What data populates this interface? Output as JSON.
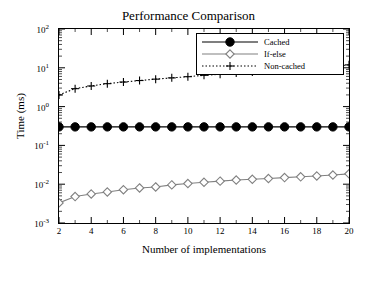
{
  "chart_data": {
    "type": "line",
    "title": "Performance Comparison",
    "xlabel": "Number of implementations",
    "ylabel": "Time (ms)",
    "yscale": "log",
    "xscale": "linear",
    "xlim": [
      2,
      20
    ],
    "ylim": [
      0.001,
      100
    ],
    "grid": false,
    "legend_position": "top-right",
    "x_ticks": [
      "2",
      "4",
      "6",
      "8",
      "10",
      "12",
      "14",
      "16",
      "18",
      "20"
    ],
    "x_tick_values": [
      2,
      4,
      6,
      8,
      10,
      12,
      14,
      16,
      18,
      20
    ],
    "y_ticks": [
      "10^-3",
      "10^-2",
      "10^-1",
      "10^0",
      "10^1",
      "10^2"
    ],
    "y_tick_values": [
      0.001,
      0.01,
      0.1,
      1,
      10,
      100
    ],
    "x": [
      2,
      3,
      4,
      5,
      6,
      7,
      8,
      9,
      10,
      11,
      12,
      13,
      14,
      15,
      16,
      17,
      18,
      19,
      20
    ],
    "series": [
      {
        "name": "Cached",
        "marker": "filled-circle",
        "linestyle": "solid",
        "color": "#000000",
        "values": [
          0.3,
          0.3,
          0.3,
          0.3,
          0.3,
          0.3,
          0.3,
          0.3,
          0.3,
          0.3,
          0.3,
          0.3,
          0.3,
          0.3,
          0.3,
          0.3,
          0.3,
          0.3,
          0.3
        ]
      },
      {
        "name": "If-else",
        "marker": "open-diamond",
        "linestyle": "solid",
        "color": "#808080",
        "values": [
          0.0033,
          0.0048,
          0.0056,
          0.0063,
          0.0072,
          0.008,
          0.0085,
          0.0096,
          0.0104,
          0.0112,
          0.012,
          0.0128,
          0.0134,
          0.014,
          0.0148,
          0.0155,
          0.0163,
          0.0172,
          0.0185
        ]
      },
      {
        "name": "Non-cached",
        "marker": "plus",
        "linestyle": "dotted",
        "color": "#000000",
        "values": [
          2.0,
          2.9,
          3.4,
          3.9,
          4.3,
          4.7,
          5.1,
          5.5,
          5.9,
          6.4,
          6.8,
          7.3,
          7.8,
          8.3,
          8.9,
          9.5,
          10.2,
          11.0,
          11.9
        ]
      }
    ]
  }
}
